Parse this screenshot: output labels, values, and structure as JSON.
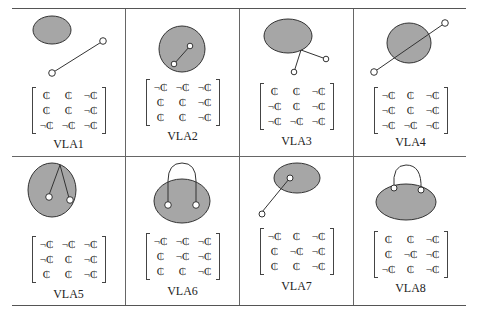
{
  "colors": {
    "fill": "#a6a6a6",
    "stroke": "#333333",
    "rule": "#555555"
  },
  "symbols": {
    "C": "₵",
    "notC": "¬₵"
  },
  "cells": [
    {
      "label": "VLA1",
      "matrix": [
        [
          "₵",
          "₵",
          "¬₵"
        ],
        [
          "₵",
          "₵",
          "¬₵"
        ],
        [
          "¬₵",
          "¬₵",
          "¬₵"
        ]
      ]
    },
    {
      "label": "VLA2",
      "matrix": [
        [
          "¬₵",
          "¬₵",
          "¬₵"
        ],
        [
          "₵",
          "₵",
          "¬₵"
        ],
        [
          "₵",
          "₵",
          "¬₵"
        ]
      ]
    },
    {
      "label": "VLA3",
      "matrix": [
        [
          "₵",
          "₵",
          "¬₵"
        ],
        [
          "¬₵",
          "₵",
          "¬₵"
        ],
        [
          "¬₵",
          "¬₵",
          "¬₵"
        ]
      ]
    },
    {
      "label": "VLA4",
      "matrix": [
        [
          "¬₵",
          "₵",
          "¬₵"
        ],
        [
          "¬₵",
          "₵",
          "¬₵"
        ],
        [
          "¬₵",
          "¬₵",
          "¬₵"
        ]
      ]
    },
    {
      "label": "VLA5",
      "matrix": [
        [
          "¬₵",
          "¬₵",
          "¬₵"
        ],
        [
          "¬₵",
          "₵",
          "¬₵"
        ],
        [
          "₵",
          "₵",
          "¬₵"
        ]
      ]
    },
    {
      "label": "VLA6",
      "matrix": [
        [
          "¬₵",
          "¬₵",
          "¬₵"
        ],
        [
          "₵",
          "¬₵",
          "¬₵"
        ],
        [
          "₵",
          "₵",
          "¬₵"
        ]
      ]
    },
    {
      "label": "VLA7",
      "matrix": [
        [
          "¬₵",
          "₵",
          "¬₵"
        ],
        [
          "₵",
          "¬₵",
          "¬₵"
        ],
        [
          "₵",
          "₵",
          "¬₵"
        ]
      ]
    },
    {
      "label": "VLA8",
      "matrix": [
        [
          "₵",
          "₵",
          "¬₵"
        ],
        [
          "₵",
          "¬₵",
          "¬₵"
        ],
        [
          "¬₵",
          "₵",
          "¬₵"
        ]
      ]
    }
  ]
}
